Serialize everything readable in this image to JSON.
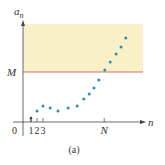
{
  "chart_data": {
    "type": "scatter",
    "title": "",
    "caption": "(a)",
    "xlabel": "n",
    "ylabel": "a",
    "ylabel_subscript": "n",
    "xlim": [
      0,
      20
    ],
    "ylim": [
      0,
      100
    ],
    "origin_label": "0",
    "x_ticks": [
      {
        "value": 1,
        "label": "1"
      },
      {
        "value": 2,
        "label": "2"
      },
      {
        "value": 3,
        "label": "3"
      },
      {
        "value": 13.2,
        "label": "N"
      }
    ],
    "threshold": {
      "label": "M",
      "value": 50,
      "color": "#d9735a"
    },
    "shaded_region": {
      "from": 50,
      "to": 98,
      "color": "#faf0c8"
    },
    "series": [
      {
        "name": "a_n",
        "color": "#2a8fb8",
        "points": [
          {
            "x": 1,
            "y": 5
          },
          {
            "x": 2,
            "y": 11
          },
          {
            "x": 3,
            "y": 16
          },
          {
            "x": 4.2,
            "y": 14
          },
          {
            "x": 5.5,
            "y": 11
          },
          {
            "x": 7.2,
            "y": 14
          },
          {
            "x": 8.7,
            "y": 16
          },
          {
            "x": 9.8,
            "y": 23
          },
          {
            "x": 10.7,
            "y": 28
          },
          {
            "x": 11.5,
            "y": 34
          },
          {
            "x": 12.3,
            "y": 42
          },
          {
            "x": 13.3,
            "y": 52
          },
          {
            "x": 14.2,
            "y": 60
          },
          {
            "x": 15.2,
            "y": 68
          },
          {
            "x": 16,
            "y": 75
          },
          {
            "x": 16.8,
            "y": 84
          }
        ]
      }
    ],
    "first_point_marker": "arrow"
  }
}
